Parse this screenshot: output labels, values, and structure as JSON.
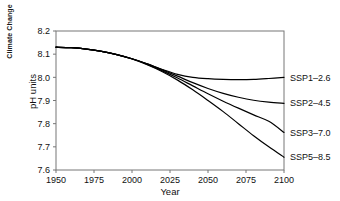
{
  "figure": {
    "side_label": "Climate Change",
    "cut_header": "",
    "frame_color": "#777777",
    "line_color": "#000000"
  },
  "chart_data": {
    "type": "line",
    "title": "",
    "xlabel": "Year",
    "ylabel": "pH units",
    "xlim": [
      1950,
      2100
    ],
    "ylim": [
      7.6,
      8.2
    ],
    "xticks": [
      1950,
      1975,
      2000,
      2025,
      2050,
      2075,
      2100
    ],
    "xticklabels": [
      "1950",
      "1975",
      "2000",
      "2025",
      "2050",
      "2075",
      "2100"
    ],
    "yticks": [
      7.6,
      7.7,
      7.8,
      7.9,
      8.0,
      8.1,
      8.2
    ],
    "yticklabels": [
      "7.6",
      "7.7",
      "7.8",
      "7.9",
      "8.0",
      "8.1",
      "8.2"
    ],
    "grid": false,
    "legend_position": "right-of-axes-inline",
    "x": [
      1950,
      1960,
      1970,
      1980,
      1990,
      2000,
      2010,
      2020,
      2030,
      2040,
      2050,
      2060,
      2070,
      2080,
      2090,
      2100
    ],
    "series": [
      {
        "name": "SSP1-2.6",
        "label": "SSP1–2.6",
        "values": [
          8.13,
          8.128,
          8.122,
          8.112,
          8.098,
          8.08,
          8.058,
          8.034,
          8.013,
          8.0,
          7.994,
          7.991,
          7.99,
          7.991,
          7.995,
          8.0
        ]
      },
      {
        "name": "SSP2-4.5",
        "label": "SSP2–4.5",
        "values": [
          8.13,
          8.128,
          8.122,
          8.112,
          8.098,
          8.08,
          8.058,
          8.032,
          8.005,
          7.977,
          7.952,
          7.931,
          7.914,
          7.901,
          7.893,
          7.888
        ]
      },
      {
        "name": "SSP3-7.0",
        "label": "SSP3–7.0",
        "values": [
          8.13,
          8.128,
          8.122,
          8.112,
          8.098,
          8.08,
          8.056,
          8.028,
          7.997,
          7.963,
          7.929,
          7.897,
          7.867,
          7.838,
          7.81,
          7.762
        ]
      },
      {
        "name": "SSP5-8.5",
        "label": "SSP5–8.5",
        "values": [
          8.13,
          8.128,
          8.122,
          8.112,
          8.098,
          8.079,
          8.054,
          8.024,
          7.988,
          7.946,
          7.9,
          7.852,
          7.8,
          7.748,
          7.7,
          7.655
        ]
      }
    ]
  }
}
